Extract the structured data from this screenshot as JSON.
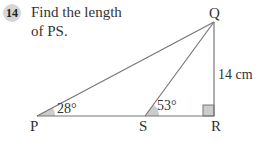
{
  "question": {
    "number": "14",
    "text_line1": "Find the length",
    "text_line2": "of PS."
  },
  "diagram": {
    "vertices": {
      "P": "P",
      "Q": "Q",
      "R": "R",
      "S": "S"
    },
    "side_QR_label": "14 cm",
    "angle_P_label": "28°",
    "angle_S_label": "53°",
    "right_angle_at": "R",
    "colors": {
      "line": "#777777",
      "angle_fill": "#cccccc",
      "badge_fill": "#d6d6d6"
    }
  }
}
